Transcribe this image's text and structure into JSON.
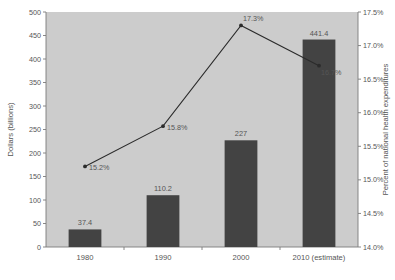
{
  "chart_data": {
    "type": "bar",
    "title": "",
    "subtitle": "",
    "categories": [
      "1980",
      "1990",
      "2000",
      "2010 (estimate)"
    ],
    "series": [
      {
        "name": "Dollars (billions)",
        "type": "bar",
        "axis": "left",
        "values": [
          37.4,
          110.2,
          227,
          441.4
        ],
        "value_labels": [
          "37.4",
          "110.2",
          "227",
          "441.4"
        ],
        "color": "#434343"
      },
      {
        "name": "Percent of national health expenditures",
        "type": "line",
        "axis": "right",
        "values": [
          15.2,
          15.8,
          17.3,
          16.7
        ],
        "value_labels": [
          "15.2%",
          "15.8%",
          "17.3%",
          "16.7%"
        ],
        "color": "#2b2b2b"
      }
    ],
    "xlabel": "",
    "ylabel": "Dollars (billions)",
    "y2label": "Percent of national health expenditures",
    "ylim": [
      0,
      500
    ],
    "y2lim": [
      14.0,
      17.5
    ],
    "yticks": [
      0,
      50,
      100,
      150,
      200,
      250,
      300,
      350,
      400,
      450,
      500
    ],
    "ytick_labels": [
      "0",
      "50",
      "100",
      "150",
      "200",
      "250",
      "300",
      "350",
      "400",
      "450",
      "500"
    ],
    "y2ticks": [
      14.0,
      14.5,
      15.0,
      15.5,
      16.0,
      16.5,
      17.0,
      17.5
    ],
    "y2tick_labels": [
      "14.0%",
      "14.5%",
      "15.0%",
      "15.5%",
      "16.0%",
      "16.5%",
      "17.0%",
      "17.5%"
    ],
    "grid": false,
    "legend": "none",
    "plot_background": "#cccccc",
    "page_background": "#ffffff"
  }
}
